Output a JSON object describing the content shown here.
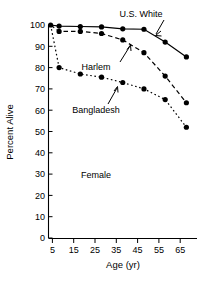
{
  "chart_data": {
    "type": "line",
    "title": "",
    "xlabel": "Age (yr)",
    "ylabel": "Percent Alive",
    "xlim": [
      0,
      70
    ],
    "ylim": [
      0,
      100
    ],
    "xticks": [
      5,
      15,
      25,
      35,
      45,
      55,
      65
    ],
    "yticks": [
      0,
      10,
      20,
      30,
      40,
      50,
      60,
      70,
      80,
      90,
      100
    ],
    "grid": false,
    "legend_position": "inline-annotations",
    "x": [
      1,
      5,
      15,
      25,
      35,
      45,
      55,
      65
    ],
    "series": [
      {
        "name": "U.S. White",
        "line_style": "solid",
        "marker": "filled-circle",
        "values": [
          100,
          99.5,
          99.3,
          99.1,
          98.2,
          98.0,
          92.0,
          85.0
        ]
      },
      {
        "name": "Harlem",
        "line_style": "dashed",
        "marker": "filled-circle",
        "values": [
          100,
          97.0,
          97.0,
          96.0,
          93.0,
          87.0,
          76.0,
          63.5
        ]
      },
      {
        "name": "Bangladesh",
        "line_style": "dotted",
        "marker": "filled-circle",
        "values": [
          100,
          80.0,
          77.0,
          75.5,
          73.0,
          70.0,
          65.0,
          52.0
        ]
      }
    ],
    "annotations": [
      {
        "text": "U.S. White",
        "points_to_series": "U.S. White"
      },
      {
        "text": "Harlem",
        "points_to_series": "Harlem"
      },
      {
        "text": "Bangladesh",
        "points_to_series": "Bangladesh"
      },
      {
        "text": "Female",
        "points_to_series": null
      }
    ]
  },
  "axes": {
    "y_title": "Percent Alive",
    "x_title": "Age (yr)",
    "y_tick_labels": [
      "100",
      "90",
      "80",
      "70",
      "60",
      "50",
      "40",
      "30",
      "20",
      "10",
      "0"
    ],
    "x_tick_labels": [
      "5",
      "15",
      "25",
      "35",
      "45",
      "55",
      "65"
    ]
  },
  "labels": {
    "us_white": "U.S. White",
    "harlem": "Harlem",
    "bangladesh": "Bangladesh",
    "female": "Female"
  },
  "colors": {
    "ink": "#000000",
    "background": "#ffffff"
  }
}
